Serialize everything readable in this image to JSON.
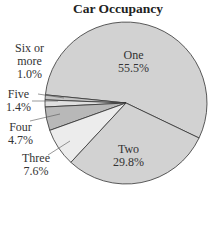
{
  "chart_data": {
    "type": "pie",
    "title": "Car Occupancy",
    "categories": [
      "One",
      "Two",
      "Three",
      "Four",
      "Five",
      "Six or more"
    ],
    "values": [
      55.5,
      29.8,
      7.6,
      4.7,
      1.4,
      1.0
    ],
    "value_labels": [
      "55.5%",
      "29.8%",
      "7.6%",
      "4.7%",
      "1.4%",
      "1.0%"
    ],
    "unit": "%",
    "colors": [
      "#d2d2d2",
      "#d2d2d2",
      "#ececec",
      "#b8b8b8",
      "#e0e0e0",
      "#c4c4c4"
    ],
    "legend": "none (labels placed on/next to slices)"
  },
  "labels": {
    "one": {
      "name": "One",
      "value": "55.5%"
    },
    "two": {
      "name": "Two",
      "value": "29.8%"
    },
    "three": {
      "name": "Three",
      "value": "7.6%"
    },
    "four": {
      "name": "Four",
      "value": "4.7%"
    },
    "five": {
      "name": "Five",
      "value": "1.4%"
    },
    "six": {
      "name_line1": "Six or",
      "name_line2": "more",
      "value": "1.0%"
    }
  }
}
